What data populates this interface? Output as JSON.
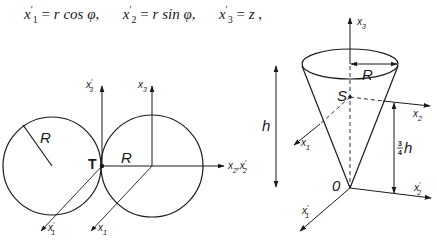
{
  "formula": {
    "terms": [
      {
        "lhs_var": "x",
        "lhs_sub": "1",
        "lhs_prime": "′",
        "rhs": "r cos φ"
      },
      {
        "lhs_var": "x",
        "lhs_sub": "2",
        "lhs_prime": "′",
        "rhs": "r sin φ"
      },
      {
        "lhs_var": "x",
        "lhs_sub": "3",
        "lhs_prime": "′",
        "rhs": "z"
      }
    ],
    "separator": ",",
    "eq": "="
  },
  "left_diagram": {
    "labels": {
      "R_left": "R",
      "R_right": "R",
      "tangent_point": "T",
      "x3_prime": "x",
      "x3_prime_sub": "3",
      "x3": "x",
      "x3_sub": "3",
      "x2_axis": "x",
      "x2_axis_sub": "2",
      "x2_axis_sep": ",",
      "x2_prime_axis": "x",
      "x2_prime_axis_sub": "2",
      "x1_prime": "x",
      "x1_prime_sub": "1",
      "x1": "x",
      "x1_sub": "1",
      "prime": "′"
    }
  },
  "right_diagram": {
    "labels": {
      "x3": "x",
      "x3_sub": "3",
      "R": "R",
      "S": "S",
      "h": "h",
      "x2": "x",
      "x2_sub": "2",
      "x1": "x",
      "x1_sub": "1",
      "three_quarter_num": "3",
      "three_quarter_den": "4",
      "three_quarter_h": "h",
      "O": "0",
      "x2_prime": "x",
      "x2_prime_sub": "2",
      "x1_prime": "x",
      "x1_prime_sub": "1",
      "prime": "′"
    }
  },
  "colors": {
    "ink": "#1a1a1a",
    "background": "#ffffff"
  }
}
